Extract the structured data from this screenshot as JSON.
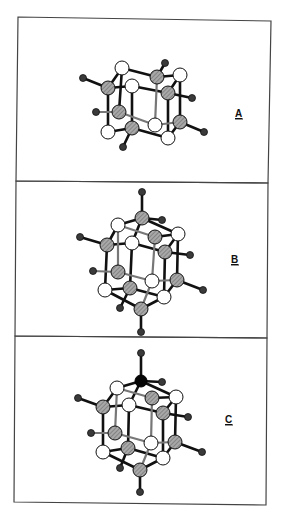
{
  "figure": {
    "panels": [
      {
        "id": "A",
        "label": "A",
        "description": "cage cluster view A"
      },
      {
        "id": "B",
        "label": "B",
        "description": "cage cluster view B, capped top and bottom with gray atoms"
      },
      {
        "id": "C",
        "label": "C",
        "description": "cage cluster view C, top cap atom black"
      }
    ],
    "legend": {
      "white_atom_color": "#ffffff",
      "gray_atom_color": "#999999",
      "small_atom_color": "#3a3a3a",
      "black_atom_color": "#050505"
    }
  }
}
